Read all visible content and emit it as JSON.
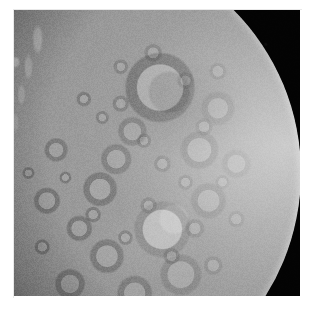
{
  "view": {
    "kind": "astronomical-photograph",
    "subject": "cratered icy moon, crescent/gibbous phase",
    "width_px": 310,
    "height_px": 310,
    "background_color": "#ffffff"
  },
  "frame": {
    "left_px": 14,
    "top_px": 10,
    "width_px": 286,
    "height_px": 286,
    "sky_color": "#030303",
    "hairline_color": "#e9e9e9"
  },
  "moon": {
    "body_color": "#9a9a9a",
    "bright_limb_color": "#e2e2e2",
    "highlight_color": "#efefef",
    "midtone_color": "#8e8e8e",
    "shadow_color": "#2a2a2a",
    "terminator_color": "#0a0a0a",
    "disk_left_px": -175,
    "disk_top_px": -68,
    "disk_diameter_px": 462,
    "illumination_direction": "right",
    "terminator_side": "left"
  },
  "features": {
    "large_craters": [
      {
        "name": "upper-large-crater",
        "cx_pct": 69.5,
        "cy_pct": 31.5
      },
      {
        "name": "bright-central-crater",
        "cx_pct": 70.0,
        "cy_pct": 62.2
      },
      {
        "name": "mid-left-crater",
        "cx_pct": 56.5,
        "cy_pct": 53.5
      },
      {
        "name": "lower-right-crater",
        "cx_pct": 74.0,
        "cy_pct": 72.0
      }
    ],
    "terrain": "heavily cratered",
    "ridges": "bright scarp ridges along terminator"
  }
}
